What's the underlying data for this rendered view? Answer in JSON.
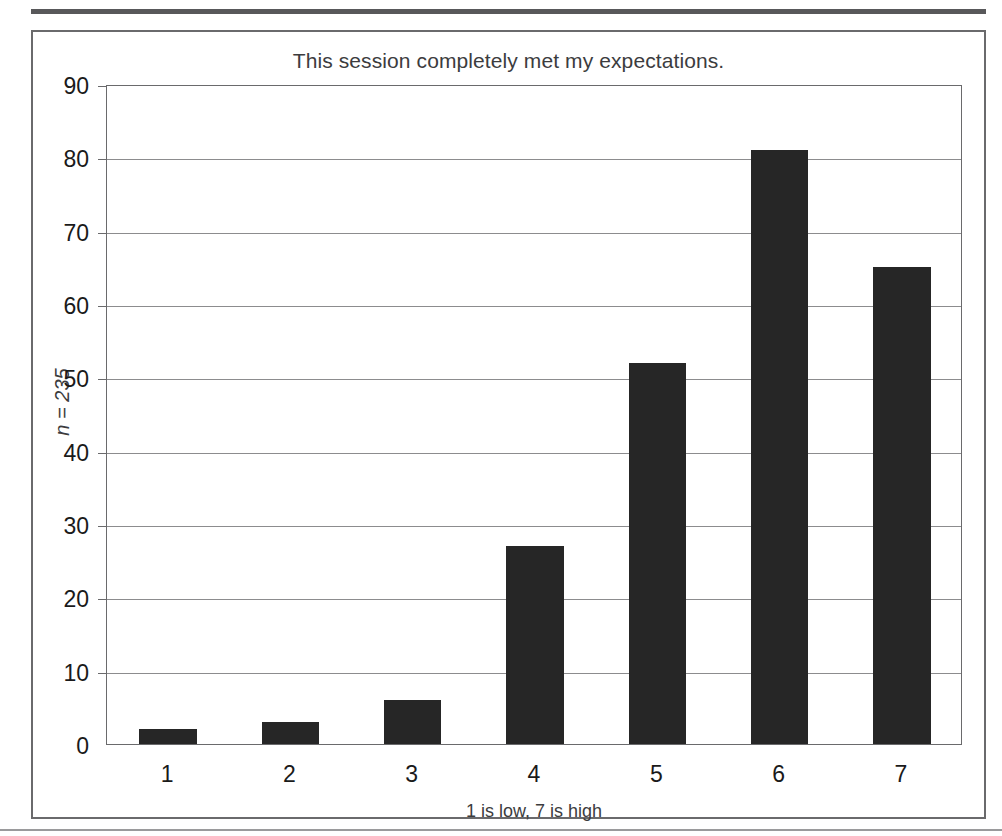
{
  "figure": {
    "title": "This session completely met my expectations.",
    "y_axis_title": "n = 235",
    "x_axis_title": "1 is low, 7 is high",
    "bar_color": "#262626",
    "frame_color": "#6a6a6c",
    "grid_color": "#8c8c8e"
  },
  "chart_data": {
    "type": "bar",
    "title": "This session completely met my expectations.",
    "xlabel": "1 is low, 7 is high",
    "ylabel": "n = 235",
    "categories": [
      "1",
      "2",
      "3",
      "4",
      "5",
      "6",
      "7"
    ],
    "values": [
      2,
      3,
      6,
      27,
      52,
      81,
      65
    ],
    "ylim": [
      0,
      90
    ],
    "yticks": [
      0,
      10,
      20,
      30,
      40,
      50,
      60,
      70,
      80,
      90
    ],
    "grid": true,
    "legend": null,
    "n": 235
  }
}
